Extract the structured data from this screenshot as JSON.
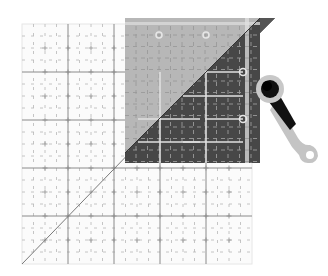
{
  "illustration": {
    "title": "Quilting ruler with rotary cutter",
    "subject": "Square grid cutting mat with a diagonal line, a gray quilting ruler placed on the upper-right, and a rotary cutter tool",
    "colors": {
      "background": "#ffffff",
      "grid_major": "#8a8a8a",
      "grid_minor": "#b8b8b8",
      "diagonal": "#7a7a7a",
      "ruler_light": "#b7b7b7",
      "ruler_dark": "#474747",
      "ruler_markings_light": "#d9d9d9",
      "ruler_markings_dark": "#e0e0e0",
      "cutter_handle_light": "#c4c4c4",
      "cutter_handle_dark": "#111111",
      "cutter_blade": "#c8c8c8"
    },
    "mat": {
      "x": 22,
      "y": 24,
      "width": 230,
      "height": 240,
      "major_divisions": 5
    },
    "ruler": {
      "x": 125,
      "y": 18,
      "width": 135,
      "height": 145,
      "slant_top_right_x": 275
    },
    "cutter": {
      "blade_center": [
        270,
        90
      ],
      "blade_radius": 14,
      "handle_end": [
        312,
        152
      ]
    }
  }
}
